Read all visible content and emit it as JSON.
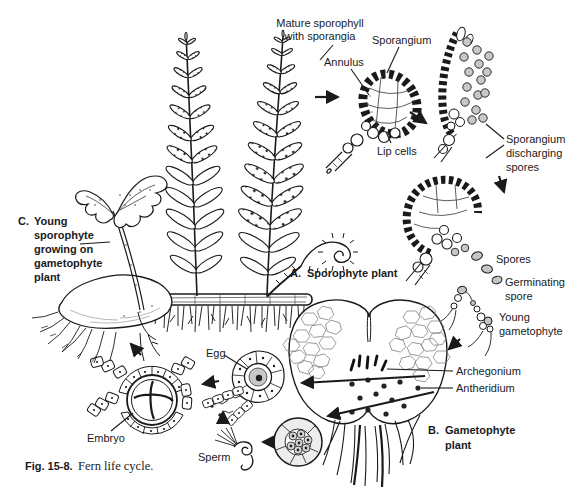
{
  "figure": {
    "caption_fig": "Fig. 15-8.",
    "caption_text": "Fern life cycle."
  },
  "labels": {
    "mature_sporophyll_1": "Mature sporophyll",
    "mature_sporophyll_2": "with sporangia",
    "sporangium": "Sporangium",
    "annulus": "Annulus",
    "lip_cells": "Lip cells",
    "discharging_1": "Sporangium",
    "discharging_2": "discharging",
    "discharging_3": "spores",
    "spores": "Spores",
    "germinating_1": "Germinating",
    "germinating_2": "spore",
    "young_gametophyte_1": "Young",
    "young_gametophyte_2": "gametophyte",
    "archegonium": "Archegonium",
    "antheridium": "Antheridium",
    "egg": "Egg",
    "sperm": "Sperm",
    "embryo": "Embryo"
  },
  "sections": {
    "a_letter": "A.",
    "a_text": "Sporophyte plant",
    "b_letter": "B.",
    "b_line1": "Gametophyte",
    "b_line2": "plant",
    "c_letter": "C.",
    "c_line1": "Young",
    "c_line2": "sporophyte",
    "c_line3": "growing on",
    "c_line4": "gametophyte",
    "c_line5": "plant"
  },
  "colors": {
    "ink": "#1a1a1a",
    "paper": "#ffffff",
    "spore_fill": "#c8c8c8"
  }
}
